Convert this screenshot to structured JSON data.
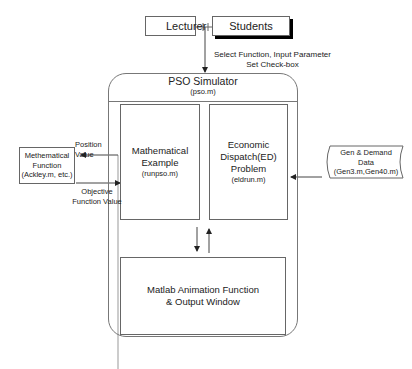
{
  "diagram": {
    "actors": {
      "lecturer": "Lecturer",
      "students": "Students"
    },
    "input_label": {
      "line1": "Select Function, Input Parameter",
      "line2": "Set Check-box"
    },
    "simulator": {
      "title": "PSO Simulator",
      "file": "(pso.m)"
    },
    "math_example": {
      "line1": "Mathematical",
      "line2": "Example",
      "file": "(runpso.m)"
    },
    "ed_problem": {
      "line1": "Economic",
      "line2": "Dispatch(ED)",
      "line3": "Problem",
      "file": "(eldrun.m)"
    },
    "animation": {
      "line1": "Matlab Animation Function",
      "line2": "& Output Window"
    },
    "math_function": {
      "line1": "Methematical",
      "line2": "Function",
      "line3": "(Ackley.m, etc.)"
    },
    "position_value": {
      "line1": "Position",
      "line2": "Value"
    },
    "objective_value": {
      "line1": "Objective",
      "line2": "Function Value"
    },
    "gen_demand": {
      "line1": "Gen & Demand",
      "line2": "Data",
      "line3": "(Gen3.m,Gen40.m)"
    }
  }
}
